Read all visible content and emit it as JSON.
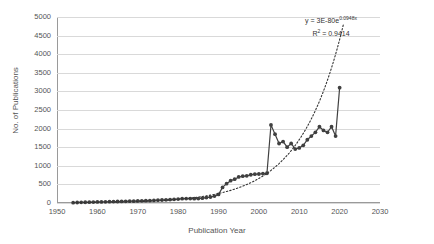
{
  "chart_data": {
    "type": "line",
    "title": "",
    "xlabel": "Publication Year",
    "ylabel": "No. of Publications",
    "xlim": [
      1950,
      2030
    ],
    "ylim": [
      0,
      5000
    ],
    "xticks": [
      1950,
      1960,
      1970,
      1980,
      1990,
      2000,
      2010,
      2020,
      2030
    ],
    "yticks": [
      0,
      500,
      1000,
      1500,
      2000,
      2500,
      3000,
      3500,
      4000,
      4500,
      5000
    ],
    "grid": "horizontal",
    "legend": "none",
    "series": [
      {
        "name": "No. of Publications",
        "marker": "circle",
        "color": "#404040",
        "x": [
          1954,
          1955,
          1956,
          1957,
          1958,
          1959,
          1960,
          1961,
          1962,
          1963,
          1964,
          1965,
          1966,
          1967,
          1968,
          1969,
          1970,
          1971,
          1972,
          1973,
          1974,
          1975,
          1976,
          1977,
          1978,
          1979,
          1980,
          1981,
          1982,
          1983,
          1984,
          1985,
          1986,
          1987,
          1988,
          1989,
          1990,
          1991,
          1992,
          1993,
          1994,
          1995,
          1996,
          1997,
          1998,
          1999,
          2000,
          2001,
          2002,
          2003,
          2004,
          2005,
          2006,
          2007,
          2008,
          2009,
          2010,
          2011,
          2012,
          2013,
          2014,
          2015,
          2016,
          2017,
          2018,
          2019,
          2020
        ],
        "values": [
          10,
          14,
          18,
          20,
          22,
          25,
          28,
          30,
          32,
          35,
          38,
          40,
          42,
          45,
          48,
          50,
          55,
          58,
          62,
          65,
          70,
          75,
          80,
          85,
          92,
          98,
          105,
          115,
          120,
          118,
          115,
          120,
          130,
          145,
          160,
          185,
          230,
          420,
          520,
          600,
          640,
          700,
          720,
          730,
          760,
          775,
          780,
          790,
          800,
          2100,
          1850,
          1600,
          1650,
          1500,
          1600,
          1450,
          1480,
          1550,
          1700,
          1800,
          1900,
          2050,
          1950,
          1900,
          2050,
          1800,
          3100
        ]
      }
    ],
    "trendline": {
      "name": "exponential-fit",
      "style": "dotted",
      "color": "#333333",
      "equation": "y = 3E-80e",
      "equation_exponent": "0.0948x",
      "r_squared_label": "R",
      "r_squared_value": " = 0.9414",
      "a": 3e-80,
      "b": 0.0948,
      "r2": 0.9414,
      "x_start": 1954,
      "x_end": 2021
    }
  },
  "axis": {
    "y_tick_labels": [
      "5000",
      "4500",
      "4000",
      "3500",
      "3000",
      "2500",
      "2000",
      "1500",
      "1000",
      "500",
      "0"
    ],
    "x_tick_labels": [
      "1950",
      "1960",
      "1970",
      "1980",
      "1990",
      "2000",
      "2010",
      "2020",
      "2030"
    ]
  }
}
